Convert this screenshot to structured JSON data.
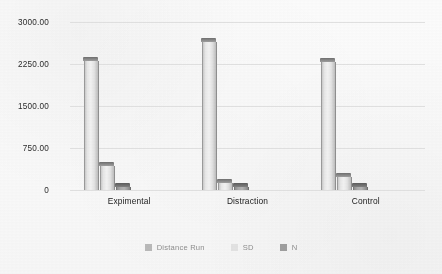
{
  "chart_data": {
    "type": "bar",
    "title": "",
    "subtitle": "",
    "xlabel": "",
    "ylabel": "",
    "categories": [
      "Expimental",
      "Distraction",
      "Control"
    ],
    "series": [
      {
        "name": "Distance Run",
        "values": [
          2300,
          2650,
          2280
        ],
        "color": "#f2f2f2"
      },
      {
        "name": "SD",
        "values": [
          430,
          120,
          230
        ],
        "color": "#f2f2f2"
      },
      {
        "name": "N",
        "values": [
          20,
          20,
          20
        ],
        "color": "#a8a8a8"
      }
    ],
    "ylim": [
      0,
      3000
    ],
    "yticks": [
      3000,
      2250,
      1500,
      750,
      0
    ],
    "ytick_labels": [
      "3000.00",
      "2250.00",
      "1500.00",
      "750.00",
      "0"
    ],
    "grid": true,
    "legend_position": "bottom",
    "style": "3d-bars-grayscale"
  },
  "legend": {
    "items": [
      {
        "label": "Distance Run",
        "color": "#b9b9b9"
      },
      {
        "label": "SD",
        "color": "#e2e2e2"
      },
      {
        "label": "N",
        "color": "#9e9e9e"
      }
    ]
  }
}
